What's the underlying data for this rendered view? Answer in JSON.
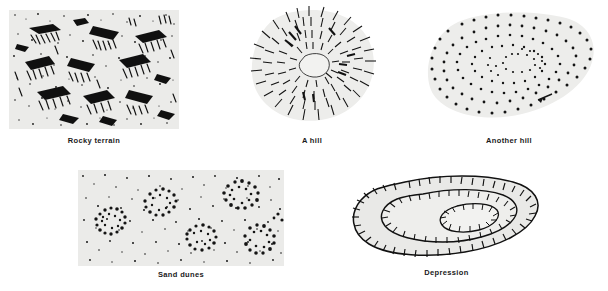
{
  "plate": {
    "title": "Terrain representation symbols",
    "background_color": "#ffffff",
    "ink_color": "#111111",
    "fill_color": "#e8e8e6",
    "caption_color": "#1a1a1a",
    "bottom_note": ""
  },
  "figures": [
    {
      "id": "rocky-terrain",
      "caption": "Rocky terrain",
      "symbol_type": "rock-hachure-texture",
      "frame": "rectangular photo panel",
      "fill_color": "#ebebe9",
      "x": 9,
      "y": 10,
      "width": 170,
      "height": 119,
      "caption_x": 9,
      "caption_y": 136,
      "caption_width": 170
    },
    {
      "id": "a-hill",
      "caption": "A hill",
      "symbol_type": "hachured-hill",
      "frame": "none",
      "fill_color": "#ededeb",
      "x": 243,
      "y": 4,
      "width": 138,
      "height": 124,
      "caption_x": 243,
      "caption_y": 136,
      "caption_width": 138
    },
    {
      "id": "another-hill",
      "caption": "Another hill",
      "symbol_type": "dotted-contour-hill",
      "frame": "none",
      "fill_color": "#ececeA",
      "x": 418,
      "y": 8,
      "width": 182,
      "height": 120,
      "caption_x": 418,
      "caption_y": 136,
      "caption_width": 182
    },
    {
      "id": "sand-dunes",
      "caption": "Sand dunes",
      "symbol_type": "stippled-dune-crescents",
      "frame": "rectangular photo panel",
      "fill_color": "#ebebe9",
      "x": 78,
      "y": 170,
      "width": 206,
      "height": 96,
      "caption_x": 78,
      "caption_y": 272,
      "caption_width": 206
    },
    {
      "id": "depression",
      "caption": "Depression",
      "symbol_type": "depression-contours-with-inward-ticks",
      "frame": "none",
      "fill_color": "#e9e9e7",
      "x": 345,
      "y": 172,
      "width": 203,
      "height": 92,
      "caption_x": 345,
      "caption_y": 270,
      "caption_width": 203
    }
  ]
}
